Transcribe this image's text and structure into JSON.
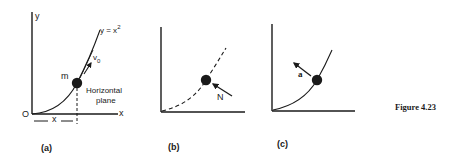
{
  "figure": {
    "caption": "Figure 4.23",
    "panels": [
      {
        "id": "a",
        "label": "(a)",
        "axis_y_label": "y",
        "axis_x_label": "x",
        "origin_label": "O",
        "curve_label": "y = x²",
        "curve_label_base": "y = x",
        "curve_label_exp": "2",
        "mass_label": "m",
        "velocity_label": "v",
        "velocity_sub": "0",
        "plane_label_line1": "Horizontal",
        "plane_label_line2": "plane",
        "dimension_label": "x",
        "curve_style": "solid"
      },
      {
        "id": "b",
        "label": "(b)",
        "force_label": "N",
        "curve_style": "dashed"
      },
      {
        "id": "c",
        "label": "(c)",
        "accel_label": "a",
        "curve_style": "solid"
      }
    ]
  },
  "colors": {
    "ink": "#1a1a1a",
    "background": "#ffffff"
  }
}
